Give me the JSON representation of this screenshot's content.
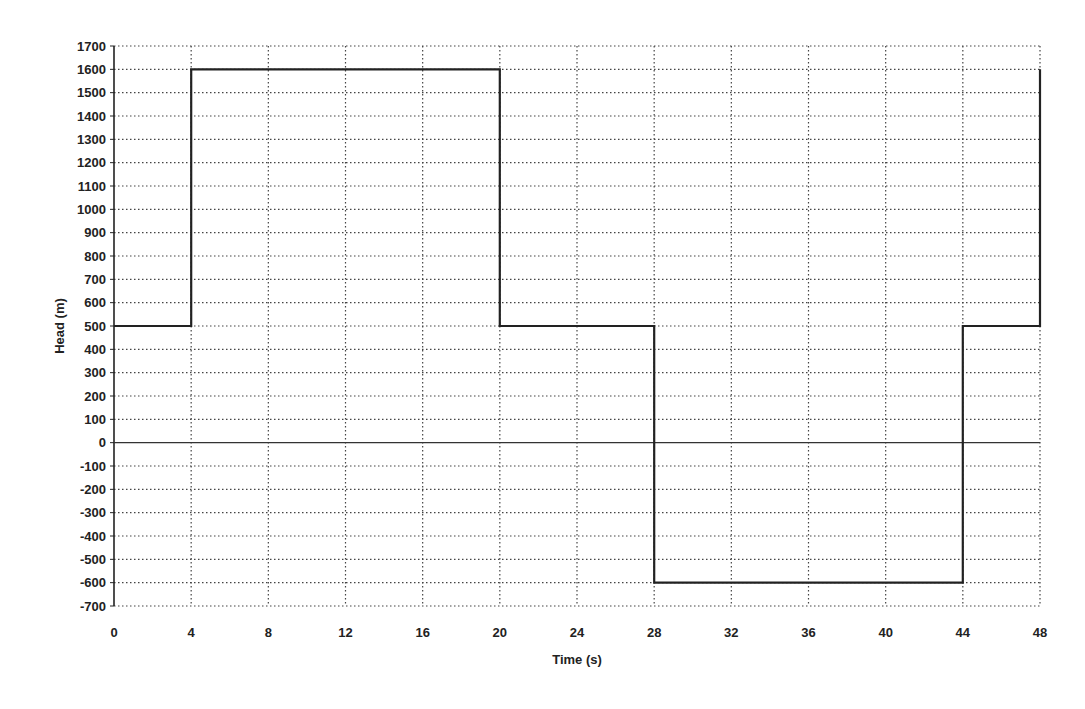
{
  "chart_data": {
    "type": "line",
    "title": "",
    "xlabel": "Time (s)",
    "ylabel": "Head (m)",
    "xlim": [
      0,
      48
    ],
    "ylim": [
      -700,
      1700
    ],
    "xticks": [
      0,
      4,
      8,
      12,
      16,
      20,
      24,
      28,
      32,
      36,
      40,
      44,
      48
    ],
    "yticks": [
      1700,
      1600,
      1500,
      1400,
      1300,
      1200,
      1100,
      1000,
      900,
      800,
      700,
      600,
      500,
      400,
      300,
      200,
      100,
      0,
      -100,
      -200,
      -300,
      -400,
      -500,
      -600,
      -700
    ],
    "grid": true,
    "grid_style": "dotted",
    "legend": null,
    "series": [
      {
        "name": "Head",
        "step": true,
        "x": [
          0,
          4,
          4,
          20,
          20,
          28,
          28,
          44,
          44,
          48,
          48
        ],
        "y": [
          500,
          500,
          1600,
          1600,
          500,
          500,
          -600,
          -600,
          500,
          500,
          1600
        ]
      }
    ],
    "line_color": "#222222"
  }
}
